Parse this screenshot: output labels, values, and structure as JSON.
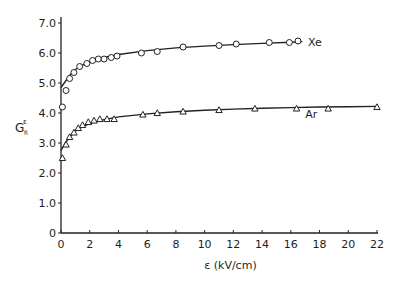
{
  "chart_data": {
    "type": "scatter",
    "title": "",
    "xlabel": "ε (kV/cm)",
    "ylabel": "G",
    "ylabel_sup": "ε",
    "ylabel_sub": "fi",
    "xlim": [
      0,
      22
    ],
    "ylim": [
      0,
      7.0
    ],
    "x_ticks": [
      0,
      2,
      4,
      6,
      8,
      10,
      12,
      14,
      16,
      18,
      20,
      22
    ],
    "x_tick_labels": [
      "0",
      "2",
      "4",
      "6",
      "8",
      "10",
      "12",
      "14",
      "16",
      "18",
      "20",
      "22"
    ],
    "y_ticks": [
      0,
      1.0,
      2.0,
      3.0,
      4.0,
      5.0,
      6.0,
      7.0
    ],
    "y_tick_labels": [
      "0",
      "1.0",
      "2.0",
      "3.0",
      "4.0",
      "5.0",
      "6.0",
      "7.0"
    ],
    "grid": false,
    "legend": "inline labels at curve ends",
    "series": [
      {
        "name": "Xe",
        "marker": "circle",
        "points": [
          [
            0.1,
            4.2
          ],
          [
            0.35,
            4.75
          ],
          [
            0.6,
            5.15
          ],
          [
            0.9,
            5.35
          ],
          [
            1.3,
            5.55
          ],
          [
            1.8,
            5.65
          ],
          [
            2.2,
            5.75
          ],
          [
            2.6,
            5.8
          ],
          [
            3.0,
            5.8
          ],
          [
            3.5,
            5.85
          ],
          [
            3.9,
            5.9
          ],
          [
            5.6,
            6.0
          ],
          [
            6.7,
            6.05
          ],
          [
            8.5,
            6.2
          ],
          [
            11.0,
            6.25
          ],
          [
            12.2,
            6.3
          ],
          [
            14.5,
            6.35
          ],
          [
            15.9,
            6.35
          ],
          [
            16.5,
            6.4
          ]
        ],
        "curve": [
          [
            0.0,
            4.85
          ],
          [
            0.3,
            5.05
          ],
          [
            0.6,
            5.25
          ],
          [
            1.0,
            5.45
          ],
          [
            1.5,
            5.6
          ],
          [
            2.0,
            5.7
          ],
          [
            3.0,
            5.85
          ],
          [
            4.0,
            5.95
          ],
          [
            6.0,
            6.08
          ],
          [
            8.0,
            6.17
          ],
          [
            10.0,
            6.23
          ],
          [
            12.0,
            6.28
          ],
          [
            14.0,
            6.32
          ],
          [
            16.0,
            6.36
          ],
          [
            16.8,
            6.38
          ]
        ]
      },
      {
        "name": "Ar",
        "marker": "triangle",
        "points": [
          [
            0.1,
            2.5
          ],
          [
            0.35,
            2.95
          ],
          [
            0.6,
            3.2
          ],
          [
            0.9,
            3.35
          ],
          [
            1.2,
            3.5
          ],
          [
            1.5,
            3.6
          ],
          [
            1.9,
            3.7
          ],
          [
            2.3,
            3.75
          ],
          [
            2.7,
            3.8
          ],
          [
            3.2,
            3.8
          ],
          [
            3.7,
            3.8
          ],
          [
            5.7,
            3.95
          ],
          [
            6.7,
            4.0
          ],
          [
            8.5,
            4.05
          ],
          [
            11.0,
            4.1
          ],
          [
            13.5,
            4.15
          ],
          [
            16.4,
            4.15
          ],
          [
            18.6,
            4.15
          ],
          [
            22.0,
            4.2
          ]
        ],
        "curve": [
          [
            0.0,
            2.75
          ],
          [
            0.3,
            3.0
          ],
          [
            0.6,
            3.2
          ],
          [
            1.0,
            3.4
          ],
          [
            1.5,
            3.55
          ],
          [
            2.0,
            3.65
          ],
          [
            3.0,
            3.78
          ],
          [
            4.0,
            3.87
          ],
          [
            6.0,
            3.97
          ],
          [
            8.0,
            4.04
          ],
          [
            10.0,
            4.09
          ],
          [
            12.0,
            4.13
          ],
          [
            14.0,
            4.16
          ],
          [
            16.0,
            4.18
          ],
          [
            18.0,
            4.2
          ],
          [
            20.0,
            4.21
          ],
          [
            22.0,
            4.22
          ]
        ]
      }
    ],
    "annotations": [
      {
        "text": "Xe",
        "x": 17.2,
        "y": 6.25
      },
      {
        "text": "Ar",
        "x": 17.0,
        "y": 3.85
      }
    ]
  }
}
